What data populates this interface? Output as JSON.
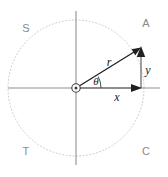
{
  "diagram": {
    "background_color": "#ffffff",
    "circle": {
      "style": "dotted",
      "color": "#c9c9c9",
      "center_x": 76,
      "center_y": 88,
      "radius": 68
    },
    "axes": {
      "color": "#909090",
      "x_label": "",
      "y_label": ""
    },
    "quadrant_labels": {
      "upper_left": "S",
      "upper_right": "A",
      "lower_left": "T",
      "lower_right": "C",
      "color": "#8a8a8a"
    },
    "point_label": "A",
    "vectors": {
      "hypotenuse_label": "r",
      "horizontal_label": "x",
      "vertical_label": "y",
      "angle_label": "θ",
      "color": "#202020"
    },
    "origin_marker": "origin-circle"
  }
}
